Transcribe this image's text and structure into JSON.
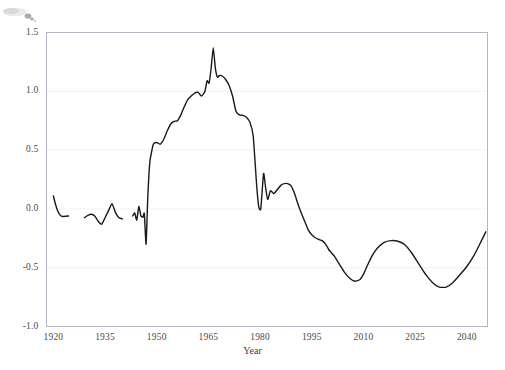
{
  "chart_data": {
    "type": "line",
    "title": "",
    "xlabel": "Year",
    "ylabel": "",
    "xlim": [
      1918,
      2046
    ],
    "ylim": [
      -1.0,
      1.5
    ],
    "grid": true,
    "grid_orientation": "horizontal",
    "legend": "none",
    "line_color": "#1a1a1a",
    "line_width": 1.4,
    "background_color": "#ffffff",
    "axes_border_color": "#b4b4c3",
    "gridline_color": "#f2f0f4",
    "xticks": [
      1920,
      1935,
      1950,
      1965,
      1980,
      1995,
      2010,
      2025,
      2040
    ],
    "xtick_labels": [
      "1920",
      "1935",
      "1950",
      "1965",
      "1980",
      "1995",
      "2010",
      "2025",
      "2040"
    ],
    "yticks": [
      -1.0,
      -0.5,
      0.0,
      0.5,
      1.0,
      1.5
    ],
    "ytick_labels": [
      "-1.0",
      "-0.5",
      "0.0",
      "0.5",
      "1.0",
      "1.5"
    ],
    "segments": [
      {
        "name": "early-observed",
        "x": [
          1920.0,
          1920.6,
          1921.3,
          1922.0,
          1922.8,
          1923.6,
          1924.4
        ],
        "y": [
          0.11,
          0.04,
          -0.02,
          -0.055,
          -0.065,
          -0.062,
          -0.06
        ]
      },
      {
        "name": "interwar-observed",
        "x": [
          1929.0,
          1930.0,
          1931.0,
          1932.0,
          1933.0,
          1934.0,
          1935.0,
          1936.0,
          1937.0,
          1938.0,
          1939.0,
          1940.0
        ],
        "y": [
          -0.075,
          -0.055,
          -0.045,
          -0.06,
          -0.105,
          -0.13,
          -0.075,
          -0.015,
          0.045,
          -0.03,
          -0.075,
          -0.085
        ]
      },
      {
        "name": "wartime-and-postwar",
        "x": [
          1943.0,
          1943.6,
          1944.2,
          1944.8,
          1945.4,
          1946.0,
          1946.4,
          1946.9,
          1947.4,
          1948.0,
          1949.0,
          1950.0,
          1951.0,
          1952.0,
          1953.0,
          1954.0,
          1955.0,
          1956.0,
          1957.0,
          1958.0,
          1959.0,
          1960.0,
          1961.0,
          1962.0,
          1963.0,
          1964.0,
          1964.6,
          1965.2,
          1965.8,
          1966.4,
          1967.0,
          1967.6,
          1968.2,
          1969.0,
          1970.0,
          1971.0,
          1972.0,
          1973.0,
          1974.0,
          1975.0,
          1976.0,
          1977.0,
          1978.0,
          1979.0,
          1979.6,
          1980.2,
          1981.0,
          1981.6,
          1982.2,
          1983.0,
          1984.0,
          1985.0,
          1986.0,
          1987.0,
          1988.0,
          1989.0,
          1990.0,
          1991.0,
          1992.0,
          1993.0,
          1994.0,
          1995.0,
          1996.0,
          1997.0,
          1998.0,
          1999.0,
          2000.0
        ],
        "y": [
          -0.06,
          -0.035,
          -0.095,
          0.02,
          -0.06,
          -0.07,
          -0.04,
          -0.3,
          0.1,
          0.4,
          0.55,
          0.565,
          0.55,
          0.59,
          0.66,
          0.72,
          0.745,
          0.75,
          0.8,
          0.87,
          0.93,
          0.96,
          0.985,
          0.99,
          0.96,
          1.0,
          1.09,
          1.07,
          1.2,
          1.37,
          1.2,
          1.12,
          1.135,
          1.13,
          1.1,
          1.05,
          0.96,
          0.83,
          0.8,
          0.795,
          0.78,
          0.74,
          0.62,
          0.2,
          0.02,
          0.0,
          0.3,
          0.18,
          0.08,
          0.155,
          0.13,
          0.165,
          0.2,
          0.215,
          0.215,
          0.195,
          0.13,
          0.04,
          -0.04,
          -0.11,
          -0.18,
          -0.22,
          -0.245,
          -0.26,
          -0.27,
          -0.3,
          -0.35
        ]
      },
      {
        "name": "projection",
        "x": [
          2000.0,
          2001.5,
          2003.0,
          2004.5,
          2006.0,
          2007.5,
          2009.0,
          2010.0,
          2011.0,
          2012.5,
          2014.0,
          2016.0,
          2018.0,
          2020.0,
          2022.0,
          2024.0,
          2026.0,
          2028.0,
          2030.0,
          2032.0,
          2034.0,
          2036.0,
          2038.0,
          2040.0,
          2042.0,
          2044.0,
          2045.5
        ],
        "y": [
          -0.35,
          -0.4,
          -0.47,
          -0.54,
          -0.59,
          -0.615,
          -0.6,
          -0.555,
          -0.49,
          -0.4,
          -0.335,
          -0.285,
          -0.27,
          -0.275,
          -0.305,
          -0.375,
          -0.465,
          -0.555,
          -0.625,
          -0.665,
          -0.665,
          -0.625,
          -0.56,
          -0.49,
          -0.4,
          -0.285,
          -0.195
        ]
      }
    ]
  },
  "axes": {
    "x_title": "Year"
  }
}
